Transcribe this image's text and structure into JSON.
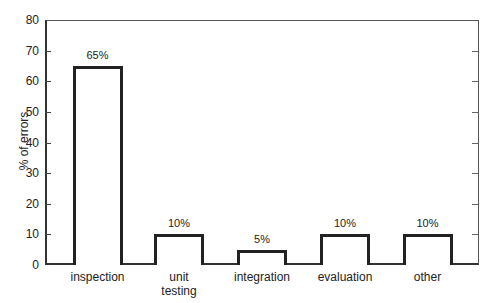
{
  "chart_data": {
    "type": "bar",
    "title": "",
    "xlabel": "",
    "ylabel": "% of errors",
    "ylim": [
      0,
      80
    ],
    "yticks": [
      0,
      10,
      20,
      30,
      40,
      50,
      60,
      70,
      80
    ],
    "grid": false,
    "legend": null,
    "categories": [
      "inspection",
      "unit\ntesting",
      "integration",
      "evaluation",
      "other"
    ],
    "values": [
      65,
      10,
      5,
      10,
      10
    ],
    "data_labels": [
      "65%",
      "10%",
      "5%",
      "10%",
      "10%"
    ]
  }
}
